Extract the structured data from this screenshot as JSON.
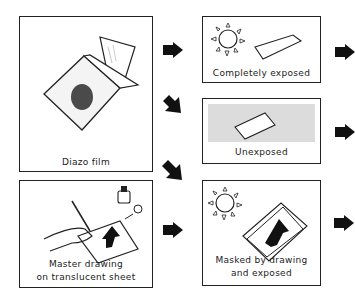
{
  "boxes": {
    "diazo_film": {
      "label": "Diazo film"
    },
    "master_drawing": {
      "label_line1": "Master drawing",
      "label_line2": "on translucent sheet"
    },
    "completely_exposed": {
      "label": "Completely exposed"
    },
    "unexposed": {
      "label": "Unexposed"
    },
    "masked_exposed": {
      "label_line1": "Masked by drawing",
      "label_line2": "and exposed"
    }
  },
  "colors": {
    "ink": "#222222",
    "dot": "#4a4a4a",
    "shade": "#dcdcdc"
  }
}
